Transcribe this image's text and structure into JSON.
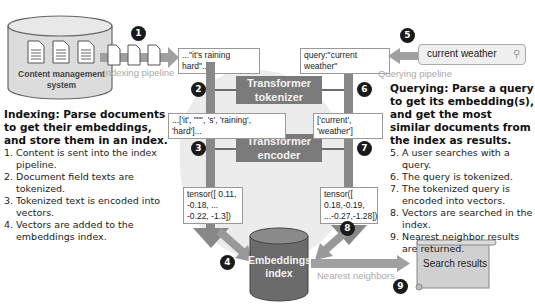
{
  "cms": {
    "label": "Content management system"
  },
  "pipelines": {
    "indexing": "Indexing pipeline",
    "querying": "Querying pipeline"
  },
  "badges": [
    "1",
    "2",
    "3",
    "4",
    "5",
    "6",
    "7",
    "8",
    "9"
  ],
  "indexing_side": {
    "input_text": "...\"it's raining hard\"...",
    "tokens": "...['it', '\"\"', 's', 'raining', 'hard']...",
    "tensor": "tensor([ 0.11, -0.18, ... -0.22, -1.3])"
  },
  "query_side": {
    "query_text": "query:\"current weather\"",
    "search_value": "current weather",
    "tokens": "['current', 'weather']",
    "tensor": "tensor([ 0.18,-0.19, ...-0.27,-1.28])"
  },
  "processors": {
    "tokenizer": [
      "Transformer",
      "tokenizer"
    ],
    "encoder": [
      "Transformer",
      "encoder"
    ]
  },
  "index": {
    "label": [
      "Embeddings",
      "index"
    ]
  },
  "nearest_label": "Nearest neighbors",
  "results": {
    "label": "Search results"
  },
  "indexing_desc": {
    "heading": "Indexing: Parse documents to get their embeddings, and store them in an index.",
    "steps": [
      "1. Content is sent into the index pipeline.",
      "2. Document field texts are tokenized.",
      "3. Tokenized text is encoded into vectors.",
      "4. Vectors are added to the embeddings index."
    ]
  },
  "querying_desc": {
    "heading": "Querying: Parse a query to get its embedding(s), and get the most similar documents from the index as results.",
    "steps": [
      "5. A user searches with a query.",
      "6. The query is tokenized.",
      "7. The tokenized query is encoded into vectors.",
      "8. Vectors are searched in the index.",
      "9. Nearest neighbor results are returned."
    ]
  }
}
